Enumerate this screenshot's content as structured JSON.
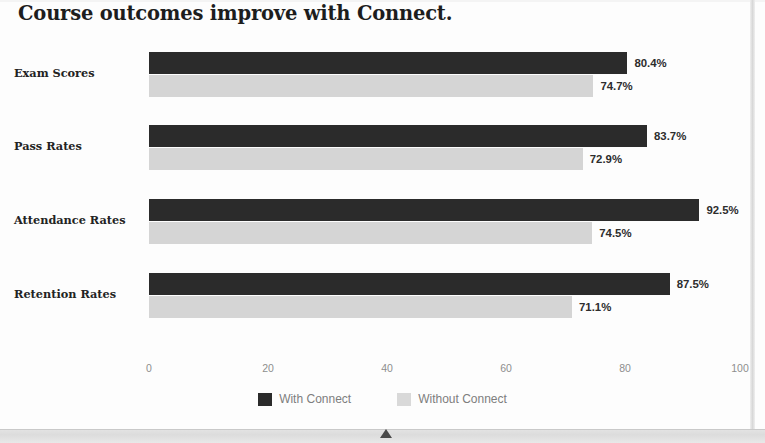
{
  "chart_data": {
    "type": "bar",
    "orientation": "horizontal",
    "title": "Course outcomes improve with Connect.",
    "categories": [
      "Exam Scores",
      "Pass Rates",
      "Attendance Rates",
      "Retention Rates"
    ],
    "series": [
      {
        "name": "With Connect",
        "color": "#2b2b2b",
        "values": [
          80.4,
          72.9,
          92.5,
          87.5
        ],
        "labels": [
          "80.4%",
          "83.7%",
          "92.5%",
          "87.5%"
        ]
      },
      {
        "name": "Without Connect",
        "color": "#d5d5d5",
        "values": [
          74.7,
          72.9,
          74.5,
          71.1
        ],
        "labels": [
          "74.7%",
          "72.9%",
          "74.5%",
          "71.1%"
        ]
      }
    ],
    "groups": [
      {
        "category": "Exam Scores",
        "with_connect": 80.4,
        "with_connect_label": "80.4%",
        "without_connect": 74.7,
        "without_connect_label": "74.7%"
      },
      {
        "category": "Pass Rates",
        "with_connect": 83.7,
        "with_connect_label": "83.7%",
        "without_connect": 72.9,
        "without_connect_label": "72.9%"
      },
      {
        "category": "Attendance Rates",
        "with_connect": 92.5,
        "with_connect_label": "92.5%",
        "without_connect": 74.5,
        "without_connect_label": "74.5%"
      },
      {
        "category": "Retention Rates",
        "with_connect": 87.5,
        "with_connect_label": "87.5%",
        "without_connect": 71.1,
        "without_connect_label": "71.1%"
      }
    ],
    "xlabel": "",
    "ylabel": "",
    "xlim": [
      0,
      100
    ],
    "xticks": [
      0,
      20,
      40,
      60,
      80,
      100
    ],
    "xtick_labels": [
      "0",
      "20",
      "40",
      "60",
      "80",
      "100"
    ],
    "grid": false,
    "legend_position": "bottom-center",
    "value_label_suffix": "%"
  },
  "legend": {
    "items": [
      {
        "label": "With Connect",
        "color": "#2b2b2b"
      },
      {
        "label": "Without Connect",
        "color": "#d9d9d9"
      }
    ]
  },
  "colors": {
    "series_dark": "#2b2b2b",
    "series_light": "#d5d5d5",
    "title_text": "#1d1d1d",
    "axis_text": "#8e8e8e",
    "legend_text": "#7e7e7e",
    "value_text": "#2d2d2d",
    "page_background": "#fdfdfd",
    "bottom_band": "#dcdcdc"
  },
  "layout": {
    "plot_left_px": 149,
    "plot_right_px": 744,
    "bar_height_px": 22,
    "group_tops_px": [
      12,
      85,
      159,
      233
    ]
  }
}
